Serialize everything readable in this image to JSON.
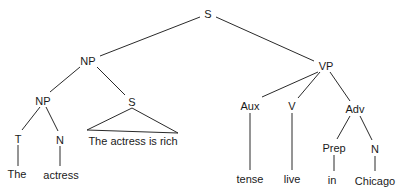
{
  "diagram": {
    "type": "syntax-tree",
    "nodes": [
      {
        "id": "s_root",
        "label": "S",
        "x": 208,
        "y": 14
      },
      {
        "id": "np_top",
        "label": "NP",
        "x": 88,
        "y": 61
      },
      {
        "id": "vp",
        "label": "VP",
        "x": 326,
        "y": 66
      },
      {
        "id": "np_low",
        "label": "NP",
        "x": 43,
        "y": 101
      },
      {
        "id": "s_sub",
        "label": "S",
        "x": 132,
        "y": 102
      },
      {
        "id": "s_sub_text",
        "label": "The actress is rich",
        "x": 133,
        "y": 141
      },
      {
        "id": "t",
        "label": "T",
        "x": 18,
        "y": 139
      },
      {
        "id": "n1",
        "label": "N",
        "x": 60,
        "y": 140
      },
      {
        "id": "the",
        "label": "The",
        "x": 17,
        "y": 174
      },
      {
        "id": "actress",
        "label": "actress",
        "x": 61,
        "y": 175
      },
      {
        "id": "aux",
        "label": "Aux",
        "x": 250,
        "y": 106
      },
      {
        "id": "v",
        "label": "V",
        "x": 292,
        "y": 106
      },
      {
        "id": "adv",
        "label": "Adv",
        "x": 355,
        "y": 109
      },
      {
        "id": "prep",
        "label": "Prep",
        "x": 334,
        "y": 148
      },
      {
        "id": "n2",
        "label": "N",
        "x": 375,
        "y": 149
      },
      {
        "id": "tense",
        "label": "tense",
        "x": 250,
        "y": 179
      },
      {
        "id": "live",
        "label": "live",
        "x": 292,
        "y": 179
      },
      {
        "id": "in",
        "label": "in",
        "x": 332,
        "y": 180
      },
      {
        "id": "chicago",
        "label": "Chicago",
        "x": 375,
        "y": 181
      }
    ],
    "edges": [
      {
        "x1": 200,
        "y1": 17,
        "x2": 100,
        "y2": 56
      },
      {
        "x1": 216,
        "y1": 17,
        "x2": 314,
        "y2": 61
      },
      {
        "x1": 80,
        "y1": 67,
        "x2": 50,
        "y2": 92
      },
      {
        "x1": 97,
        "y1": 67,
        "x2": 125,
        "y2": 95
      },
      {
        "x1": 40,
        "y1": 107,
        "x2": 22,
        "y2": 130
      },
      {
        "x1": 46,
        "y1": 107,
        "x2": 58,
        "y2": 131
      },
      {
        "x1": 18,
        "y1": 145,
        "x2": 18,
        "y2": 166
      },
      {
        "x1": 60,
        "y1": 146,
        "x2": 60,
        "y2": 166
      },
      {
        "x1": 318,
        "y1": 72,
        "x2": 262,
        "y2": 97
      },
      {
        "x1": 320,
        "y1": 72,
        "x2": 298,
        "y2": 98
      },
      {
        "x1": 330,
        "y1": 72,
        "x2": 350,
        "y2": 101
      },
      {
        "x1": 250,
        "y1": 113,
        "x2": 250,
        "y2": 170
      },
      {
        "x1": 292,
        "y1": 113,
        "x2": 292,
        "y2": 170
      },
      {
        "x1": 350,
        "y1": 116,
        "x2": 337,
        "y2": 139
      },
      {
        "x1": 360,
        "y1": 116,
        "x2": 372,
        "y2": 140
      },
      {
        "x1": 334,
        "y1": 155,
        "x2": 334,
        "y2": 171
      },
      {
        "x1": 375,
        "y1": 156,
        "x2": 375,
        "y2": 171
      }
    ],
    "triangles": [
      {
        "points": "132,108 87,130 178,133"
      }
    ],
    "colors": {
      "line": "#2a2a2a",
      "text": "#1a1a1a",
      "background": "#ffffff"
    }
  }
}
